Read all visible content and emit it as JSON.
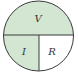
{
  "diagram": {
    "type": "ohms-law-circle",
    "sections": [
      {
        "id": "top",
        "label": "V",
        "fill": "#d3e6d2"
      },
      {
        "id": "bottom-left",
        "label": "I",
        "fill": "#d3e6d2"
      },
      {
        "id": "bottom-right",
        "label": "R",
        "fill": "#ffffff"
      }
    ],
    "colors": {
      "stroke": "#3a3a3a",
      "shaded": "#d3e6d2",
      "unshaded": "#ffffff"
    }
  }
}
